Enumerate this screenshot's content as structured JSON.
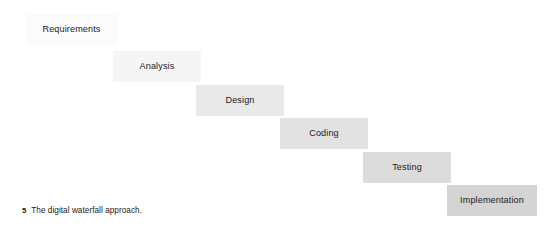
{
  "figure": {
    "caption_number": "5",
    "caption_text": "The digital waterfall approach.",
    "background_color": "#ffffff",
    "text_color": "#1b1b1b"
  },
  "diagram": {
    "type": "waterfall-cascade",
    "title": "The digital waterfall approach",
    "direction": "left-to-right-descending",
    "step_offset_x": 84,
    "step_offset_y": 34,
    "box_width": 91,
    "box_height": 31,
    "stages": [
      {
        "index": 1,
        "label": "Requirements",
        "x": 26,
        "y": 14,
        "width": 91,
        "height": 31,
        "fill": "#fbfbfb"
      },
      {
        "index": 2,
        "label": "Analysis",
        "x": 113,
        "y": 51,
        "width": 88,
        "height": 31,
        "fill": "#f5f5f5"
      },
      {
        "index": 3,
        "label": "Design",
        "x": 196,
        "y": 85,
        "width": 88,
        "height": 31,
        "fill": "#e9e9e9"
      },
      {
        "index": 4,
        "label": "Coding",
        "x": 280,
        "y": 118,
        "width": 88,
        "height": 31,
        "fill": "#e2e2e2"
      },
      {
        "index": 5,
        "label": "Testing",
        "x": 363,
        "y": 152,
        "width": 88,
        "height": 31,
        "fill": "#dcdcdc"
      },
      {
        "index": 6,
        "label": "Implementation",
        "x": 447,
        "y": 185,
        "width": 90,
        "height": 31,
        "fill": "#d4d4d4"
      }
    ]
  }
}
